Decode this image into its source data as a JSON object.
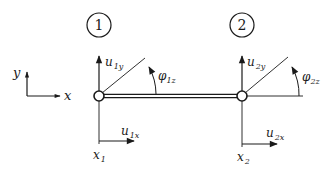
{
  "diagram": {
    "type": "beam-element-dof",
    "colors": {
      "stroke": "#1a1a1a",
      "background": "#ffffff"
    },
    "axes": {
      "y_label": "y",
      "x_label": "x"
    },
    "nodes": [
      {
        "id_label": "1",
        "uy": {
          "base": "u",
          "sub": "1y"
        },
        "ux": {
          "base": "u",
          "sub": "1x"
        },
        "phi": {
          "base": "φ",
          "sub": "1z"
        },
        "x": {
          "base": "x",
          "sub": "1"
        }
      },
      {
        "id_label": "2",
        "uy": {
          "base": "u",
          "sub": "2y"
        },
        "ux": {
          "base": "u",
          "sub": "2x"
        },
        "phi": {
          "base": "φ",
          "sub": "2z"
        },
        "x": {
          "base": "x",
          "sub": "2"
        }
      }
    ]
  }
}
